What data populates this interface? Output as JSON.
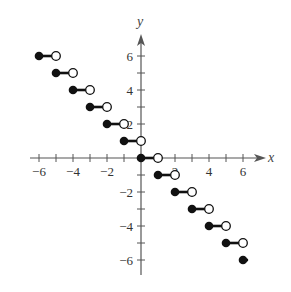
{
  "chart_data": {
    "type": "step",
    "title": "",
    "function": "f(x) = -[[x]]",
    "xlabel": "x",
    "ylabel": "y",
    "xlim": [
      -7,
      7.5
    ],
    "ylim": [
      -7,
      7.5
    ],
    "grid": false,
    "x_tick_labels": [
      "-6",
      "-4",
      "-2",
      "2",
      "4",
      "6"
    ],
    "y_tick_labels": [
      "6",
      "4",
      "2",
      "-2",
      "-4",
      "-6"
    ],
    "x_ticks": [
      -6,
      -5,
      -4,
      -3,
      -2,
      -1,
      1,
      2,
      3,
      4,
      5,
      6
    ],
    "y_ticks": [
      -6,
      -5,
      -4,
      -3,
      -2,
      -1,
      1,
      2,
      3,
      4,
      5,
      6
    ],
    "segments": [
      {
        "x_start": -6,
        "x_end": -5,
        "y": 6,
        "start_closed": true,
        "end_open": true
      },
      {
        "x_start": -5,
        "x_end": -4,
        "y": 5,
        "start_closed": true,
        "end_open": true
      },
      {
        "x_start": -4,
        "x_end": -3,
        "y": 4,
        "start_closed": true,
        "end_open": true
      },
      {
        "x_start": -3,
        "x_end": -2,
        "y": 3,
        "start_closed": true,
        "end_open": true
      },
      {
        "x_start": -2,
        "x_end": -1,
        "y": 2,
        "start_closed": true,
        "end_open": true
      },
      {
        "x_start": -1,
        "x_end": 0,
        "y": 1,
        "start_closed": true,
        "end_open": true
      },
      {
        "x_start": 0,
        "x_end": 1,
        "y": 0,
        "start_closed": true,
        "end_open": true
      },
      {
        "x_start": 1,
        "x_end": 2,
        "y": -1,
        "start_closed": true,
        "end_open": true
      },
      {
        "x_start": 2,
        "x_end": 3,
        "y": -2,
        "start_closed": true,
        "end_open": true
      },
      {
        "x_start": 3,
        "x_end": 4,
        "y": -3,
        "start_closed": true,
        "end_open": true
      },
      {
        "x_start": 4,
        "x_end": 5,
        "y": -4,
        "start_closed": true,
        "end_open": true
      },
      {
        "x_start": 5,
        "x_end": 6,
        "y": -5,
        "start_closed": true,
        "end_open": true
      },
      {
        "x_start": 6,
        "x_end": 6.3,
        "y": -6,
        "start_closed": true,
        "end_open": false
      }
    ],
    "layout": {
      "origin_px": [
        141,
        158
      ],
      "unit_px": 17
    }
  },
  "axes": {
    "x_label": "x",
    "y_label": "y"
  }
}
